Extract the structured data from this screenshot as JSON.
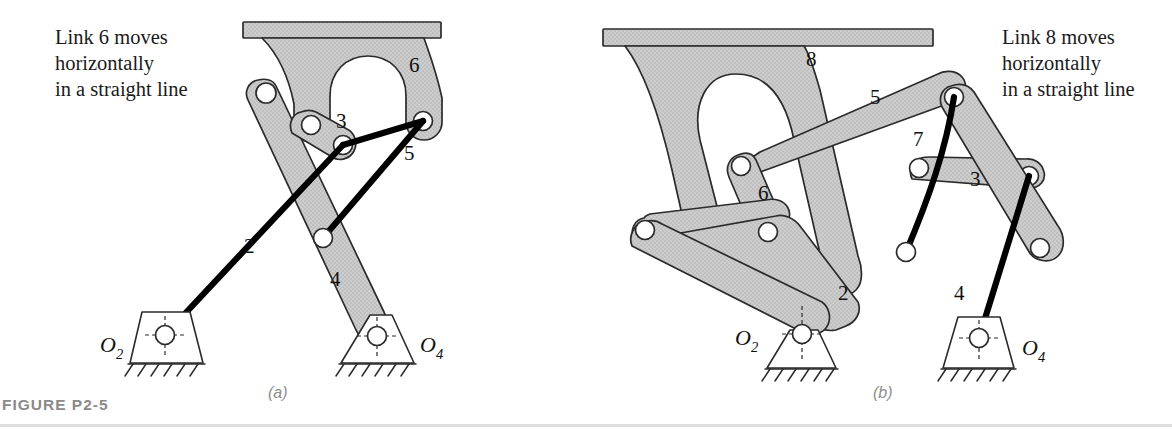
{
  "figure": {
    "caption": "FIGURE P2-5",
    "panels": [
      {
        "id": "a",
        "label": "(a)",
        "note": [
          "Link 6 moves",
          "horizontally",
          "in a straight line"
        ],
        "note_full": "Link 6 moves horizontally in a straight line",
        "link_numbers": [
          "2",
          "3",
          "4",
          "5",
          "6"
        ],
        "ground_pivots": [
          {
            "name": "O2",
            "letter": "O",
            "sub": "2"
          },
          {
            "name": "O4",
            "letter": "O",
            "sub": "4"
          }
        ]
      },
      {
        "id": "b",
        "label": "(b)",
        "note": [
          "Link 8 moves",
          "horizontally",
          "in a straight line"
        ],
        "note_full": "Link 8 moves horizontally in a straight line",
        "link_numbers": [
          "2",
          "3",
          "4",
          "5",
          "6",
          "7",
          "8"
        ],
        "ground_pivots": [
          {
            "name": "O2",
            "letter": "O",
            "sub": "2"
          },
          {
            "name": "O4",
            "letter": "O",
            "sub": "4"
          }
        ]
      }
    ]
  },
  "labels_a": {
    "n2": "2",
    "n3": "3",
    "n4": "4",
    "n5": "5",
    "n6": "6",
    "o2_letter": "O",
    "o2_sub": "2",
    "o4_letter": "O",
    "o4_sub": "4",
    "panel": "(a)",
    "note_l1": "Link 6 moves",
    "note_l2": "horizontally",
    "note_l3": "in a straight line"
  },
  "labels_b": {
    "n2": "2",
    "n3": "3",
    "n4": "4",
    "n5": "5",
    "n6": "6",
    "n7": "7",
    "n8": "8",
    "o2_letter": "O",
    "o2_sub": "2",
    "o4_letter": "O",
    "o4_sub": "4",
    "panel": "(b)",
    "note_l1": "Link 8 moves",
    "note_l2": "horizontally",
    "note_l3": "in a straight line"
  },
  "colors": {
    "body_gray": "#c9c9c9",
    "outline": "#2b2b2b",
    "black_link": "#000000",
    "caption_gray": "#8a8a8a",
    "rule_gray": "#dedede",
    "background": "#ffffff"
  }
}
